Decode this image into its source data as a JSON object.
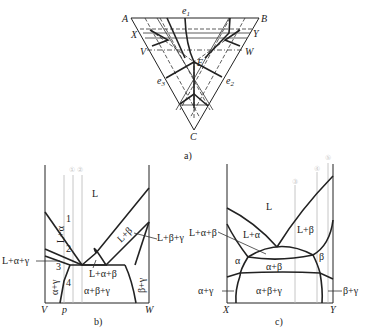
{
  "figure_a": {
    "caption": "a)",
    "vertices": {
      "A": "A",
      "B": "B",
      "C": "C"
    },
    "points": {
      "e1": "e",
      "e1_sub": "1",
      "e2": "e",
      "e2_sub": "2",
      "e3": "e",
      "e3_sub": "3",
      "E": "E"
    },
    "section_labels": {
      "X": "X",
      "Y": "Y",
      "V": "V",
      "W": "W"
    }
  },
  "figure_b": {
    "caption": "b)",
    "axis_left": "V",
    "axis_mid": "p",
    "axis_right": "W",
    "alloy_markers": [
      "①",
      "②"
    ],
    "regions": {
      "L": "L",
      "L_alpha": "L+α",
      "L_beta": "L+β",
      "L_alpha_gamma": "L+α+γ",
      "L_beta_gamma": "L+β+γ",
      "L_alpha_beta": "L+α+β",
      "alpha_gamma": "α+γ",
      "beta_gamma": "β+γ",
      "alpha_beta_gamma": "α+β+γ"
    },
    "numbers": [
      "1",
      "2",
      "3",
      "4"
    ]
  },
  "figure_c": {
    "caption": "c)",
    "axis_left": "X",
    "axis_right": "Y",
    "alloy_markers": [
      "③",
      "④",
      "⑤"
    ],
    "regions": {
      "L": "L",
      "L_alpha": "L+α",
      "L_beta": "L+β",
      "L_alpha_beta": "L+α+β",
      "alpha": "α",
      "beta": "β",
      "alpha_beta": "α+β",
      "alpha_gamma": "α+γ",
      "beta_gamma": "β+γ",
      "alpha_beta_gamma": "α+β+γ"
    }
  }
}
